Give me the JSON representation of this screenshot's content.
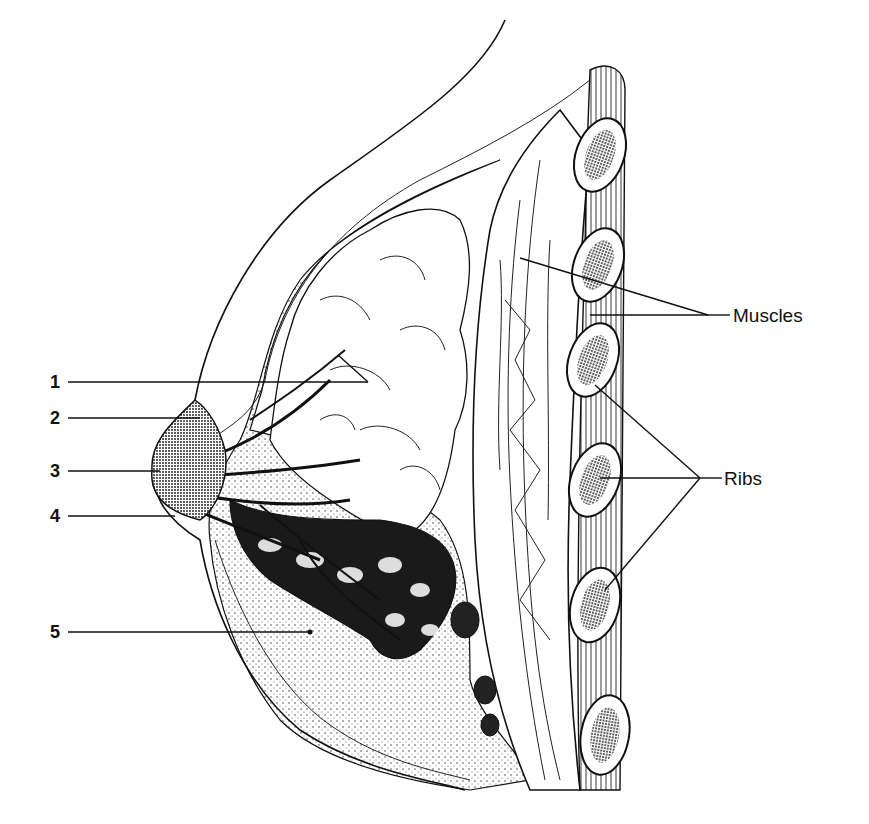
{
  "figure": {
    "numbered_labels": [
      {
        "id": "1",
        "text": "1"
      },
      {
        "id": "2",
        "text": "2"
      },
      {
        "id": "3",
        "text": "3"
      },
      {
        "id": "4",
        "text": "4"
      },
      {
        "id": "5",
        "text": "5"
      }
    ],
    "named_labels": {
      "muscles": "Muscles",
      "ribs": "Ribs"
    }
  }
}
